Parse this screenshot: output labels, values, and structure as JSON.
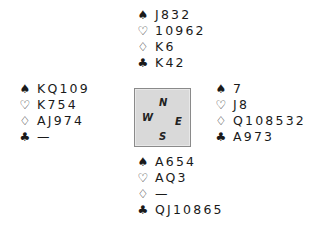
{
  "diagram": {
    "type": "bridge-deal",
    "suit_icons": {
      "spades": "♠",
      "hearts": "♡",
      "diamonds": "♢",
      "clubs": "♣"
    },
    "compass": {
      "north": "N",
      "west": "W",
      "east": "E",
      "south": "S",
      "fill_color": "#d9d9d9",
      "border_color": "#8a8a8a"
    },
    "hands": {
      "north": {
        "spades": "J832",
        "hearts": "10962",
        "diamonds": "K6",
        "clubs": "K42"
      },
      "west": {
        "spades": "KQ109",
        "hearts": "K754",
        "diamonds": "AJ974",
        "clubs": "—"
      },
      "east": {
        "spades": "7",
        "hearts": "J8",
        "diamonds": "Q108532",
        "clubs": "A973"
      },
      "south": {
        "spades": "A654",
        "hearts": "AQ3",
        "diamonds": "—",
        "clubs": "QJ10865"
      }
    }
  }
}
